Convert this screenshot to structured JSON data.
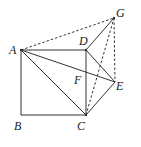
{
  "diagram": {
    "type": "geometry",
    "points": {
      "A": {
        "x": 21,
        "y": 50,
        "label": "A",
        "lx": 9,
        "ly": 54
      },
      "B": {
        "x": 21,
        "y": 115,
        "label": "B",
        "lx": 14,
        "ly": 130
      },
      "C": {
        "x": 86,
        "y": 115,
        "label": "C",
        "lx": 77,
        "ly": 130
      },
      "D": {
        "x": 86,
        "y": 50,
        "label": "D",
        "lx": 79,
        "ly": 45
      },
      "E": {
        "x": 115,
        "y": 82,
        "label": "E",
        "lx": 116,
        "ly": 90
      },
      "F": {
        "x": 86,
        "y": 76,
        "label": "F",
        "lx": 74,
        "ly": 84
      },
      "G": {
        "x": 114,
        "y": 18,
        "label": "G",
        "lx": 116,
        "ly": 17
      }
    },
    "segments": [
      {
        "from": "A",
        "to": "D",
        "style": "solid"
      },
      {
        "from": "D",
        "to": "C",
        "style": "solid"
      },
      {
        "from": "C",
        "to": "B",
        "style": "solid"
      },
      {
        "from": "B",
        "to": "A",
        "style": "solid"
      },
      {
        "from": "A",
        "to": "C",
        "style": "solid"
      },
      {
        "from": "A",
        "to": "E",
        "style": "solid"
      },
      {
        "from": "D",
        "to": "G",
        "style": "solid"
      },
      {
        "from": "D",
        "to": "E",
        "style": "solid"
      },
      {
        "from": "C",
        "to": "E",
        "style": "solid"
      },
      {
        "from": "A",
        "to": "G",
        "style": "dashed"
      },
      {
        "from": "C",
        "to": "G",
        "style": "dashed"
      },
      {
        "from": "G",
        "to": "E",
        "style": "dashed"
      }
    ],
    "labels": [
      "A",
      "B",
      "C",
      "D",
      "E",
      "F",
      "G"
    ],
    "colors": {
      "line": "#333333",
      "text": "#222222",
      "background": "#ffffff"
    }
  }
}
